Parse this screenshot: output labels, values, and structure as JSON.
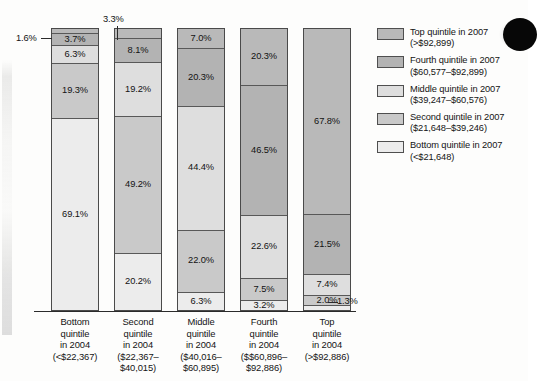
{
  "chart_data": {
    "type": "bar",
    "subtype": "100% stacked bar",
    "title": "",
    "xlabel": "",
    "ylabel": "",
    "ylim": [
      0,
      100
    ],
    "grid": false,
    "legend_position": "right",
    "categories": [
      "Bottom quintile in 2004 (<$22,367)",
      "Second quintile in 2004 ($22,367-$40,015)",
      "Middle quintile in 2004 ($40,016-$60,895)",
      "Fourth quintile in 2004 ($$60,896-$92,886)",
      "Top quintile in 2004 (>$92,886)"
    ],
    "series": [
      {
        "name": "Top quintile in 2007 (>$92,899)",
        "values": [
          1.6,
          3.3,
          7.0,
          20.3,
          67.8
        ]
      },
      {
        "name": "Fourth quintile in 2007 ($60,577-$92,899)",
        "values": [
          3.7,
          8.1,
          20.3,
          46.5,
          21.5
        ]
      },
      {
        "name": "Middle quintile in 2007 ($39,247-$60,576)",
        "values": [
          6.3,
          19.2,
          44.4,
          22.6,
          7.4
        ]
      },
      {
        "name": "Second quintile in 2007 ($21,648-$39,246)",
        "values": [
          19.3,
          49.2,
          22.0,
          7.5,
          2.0
        ]
      },
      {
        "name": "Bottom quintile in 2007 (<$21,648)",
        "values": [
          69.1,
          20.2,
          6.3,
          3.2,
          1.3
        ]
      }
    ],
    "annotations": [
      {
        "text": "1.6%",
        "series": "Top quintile in 2007 (>$92,899)",
        "category_index": 0,
        "placement": "left-callout"
      },
      {
        "text": "3.3%",
        "series": "Top quintile in 2007 (>$92,899)",
        "category_index": 1,
        "placement": "above-callout"
      },
      {
        "text": "1.3%",
        "series": "Bottom quintile in 2007 (<$21,648)",
        "category_index": 4,
        "placement": "right-callout"
      }
    ]
  },
  "bars": [
    {
      "name": "bottom-quintile-2004",
      "segments": [
        {
          "key": "top",
          "label": "1.6%",
          "value": 1.6,
          "label_inside": false
        },
        {
          "key": "fourth",
          "label": "3.7%",
          "value": 3.7,
          "label_inside": true
        },
        {
          "key": "middle",
          "label": "6.3%",
          "value": 6.3,
          "label_inside": true
        },
        {
          "key": "second",
          "label": "19.3%",
          "value": 19.3,
          "label_inside": true
        },
        {
          "key": "bottom",
          "label": "69.1%",
          "value": 69.1,
          "label_inside": true
        }
      ]
    },
    {
      "name": "second-quintile-2004",
      "segments": [
        {
          "key": "top",
          "label": "3.3%",
          "value": 3.3,
          "label_inside": false
        },
        {
          "key": "fourth",
          "label": "8.1%",
          "value": 8.1,
          "label_inside": true
        },
        {
          "key": "middle",
          "label": "19.2%",
          "value": 19.2,
          "label_inside": true
        },
        {
          "key": "second",
          "label": "49.2%",
          "value": 49.2,
          "label_inside": true
        },
        {
          "key": "bottom",
          "label": "20.2%",
          "value": 20.2,
          "label_inside": true
        }
      ]
    },
    {
      "name": "middle-quintile-2004",
      "segments": [
        {
          "key": "top",
          "label": "7.0%",
          "value": 7.0,
          "label_inside": true
        },
        {
          "key": "fourth",
          "label": "20.3%",
          "value": 20.3,
          "label_inside": true
        },
        {
          "key": "middle",
          "label": "44.4%",
          "value": 44.4,
          "label_inside": true
        },
        {
          "key": "second",
          "label": "22.0%",
          "value": 22.0,
          "label_inside": true
        },
        {
          "key": "bottom",
          "label": "6.3%",
          "value": 6.3,
          "label_inside": true
        }
      ]
    },
    {
      "name": "fourth-quintile-2004",
      "segments": [
        {
          "key": "top",
          "label": "20.3%",
          "value": 20.3,
          "label_inside": true
        },
        {
          "key": "fourth",
          "label": "46.5%",
          "value": 46.5,
          "label_inside": true
        },
        {
          "key": "middle",
          "label": "22.6%",
          "value": 22.6,
          "label_inside": true
        },
        {
          "key": "second",
          "label": "7.5%",
          "value": 7.5,
          "label_inside": true
        },
        {
          "key": "bottom",
          "label": "3.2%",
          "value": 3.2,
          "label_inside": true
        }
      ]
    },
    {
      "name": "top-quintile-2004",
      "segments": [
        {
          "key": "top",
          "label": "67.8%",
          "value": 67.8,
          "label_inside": true
        },
        {
          "key": "fourth",
          "label": "21.5%",
          "value": 21.5,
          "label_inside": true
        },
        {
          "key": "middle",
          "label": "7.4%",
          "value": 7.4,
          "label_inside": true
        },
        {
          "key": "second",
          "label": "2.0%",
          "value": 2.0,
          "label_inside": true
        },
        {
          "key": "bottom",
          "label": "1.3%",
          "value": 1.3,
          "label_inside": false
        }
      ]
    }
  ],
  "callouts": {
    "bar1_top": "1.6%",
    "bar2_top": "3.3%",
    "bar5_bottom": "1.3%"
  },
  "xaxis": {
    "labels": [
      {
        "line1": "Bottom",
        "line2": "quintile",
        "line3": "in 2004",
        "line4": "(<$22,367)",
        "line5": ""
      },
      {
        "line1": "Second",
        "line2": "quintile",
        "line3": "in 2004",
        "line4": "($22,367–",
        "line5": "$40,015)"
      },
      {
        "line1": "Middle",
        "line2": "quintile",
        "line3": "in 2004",
        "line4": "($40,016–",
        "line5": "$60,895)"
      },
      {
        "line1": "Fourth",
        "line2": "quintile",
        "line3": "in 2004",
        "line4": "($$60,896–",
        "line5": "$92,886)"
      },
      {
        "line1": "Top",
        "line2": "quintile",
        "line3": "in 2004",
        "line4": "(>$92,886)",
        "line5": ""
      }
    ]
  },
  "legend": {
    "items": [
      {
        "key": "top",
        "line1": "Top quintile in 2007",
        "line2": "(>$92,899)"
      },
      {
        "key": "fourth",
        "line1": "Fourth quintile in 2007",
        "line2": "($60,577–$92,899)"
      },
      {
        "key": "middle",
        "line1": "Middle quintile in 2007",
        "line2": "($39,247–$60,576)"
      },
      {
        "key": "second",
        "line1": "Second quintile in 2007",
        "line2": "($21,648–$39,246)"
      },
      {
        "key": "bottom",
        "line1": "Bottom quintile in 2007",
        "line2": "(<$21,648)"
      }
    ]
  },
  "colors": {
    "top": "#b9b9b9",
    "fourth": "#b3b3b3",
    "middle": "#dedede",
    "second": "#c9c9c9",
    "bottom": "#ececec",
    "axis": "#2b2b2b",
    "text": "#141414"
  }
}
